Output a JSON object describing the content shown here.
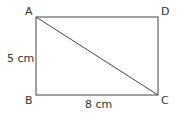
{
  "diagram": {
    "type": "rectangle-with-diagonal",
    "vertices": {
      "A": {
        "label": "A",
        "x": 36,
        "y": 17
      },
      "D": {
        "label": "D",
        "x": 158,
        "y": 17
      },
      "B": {
        "label": "B",
        "x": 36,
        "y": 95
      },
      "C": {
        "label": "C",
        "x": 158,
        "y": 95
      }
    },
    "diagonal": [
      "A",
      "C"
    ],
    "measurements": {
      "AB": "5 cm",
      "BC": "8 cm"
    },
    "colors": {
      "stroke": "#444444",
      "text": "#333333"
    }
  }
}
